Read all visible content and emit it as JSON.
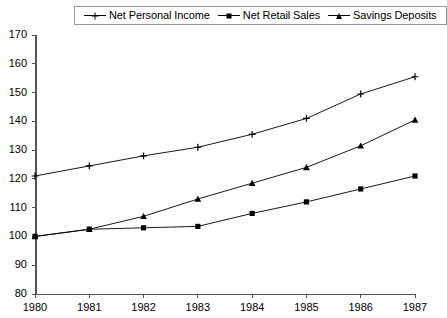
{
  "chart_data": {
    "type": "line",
    "title": "",
    "subtitle": "",
    "xlabel": "",
    "ylabel": "",
    "categories": [
      "1980",
      "1981",
      "1982",
      "1983",
      "1984",
      "1985",
      "1986",
      "1987"
    ],
    "x": [
      1980,
      1981,
      1982,
      1983,
      1984,
      1985,
      1986,
      1987
    ],
    "xlim": [
      1980,
      1987
    ],
    "ylim": [
      80,
      170
    ],
    "yticks": [
      80,
      90,
      100,
      110,
      120,
      130,
      140,
      150,
      160,
      170
    ],
    "xticks": [
      "1980",
      "1981",
      "1982",
      "1983",
      "1984",
      "1985",
      "1986",
      "1987"
    ],
    "grid": false,
    "legend_position": "top",
    "series": [
      {
        "name": "Net Personal Income",
        "marker": "plus",
        "color": "#000000",
        "values": [
          121,
          124.5,
          128,
          131,
          135.5,
          141,
          149.5,
          155.5
        ]
      },
      {
        "name": "Net Retail Sales",
        "marker": "square",
        "color": "#000000",
        "values": [
          100,
          102.5,
          103,
          103.5,
          108,
          112,
          116.5,
          121
        ]
      },
      {
        "name": "Savings Deposits",
        "marker": "triangle",
        "color": "#000000",
        "values": [
          100,
          102.5,
          107,
          113,
          118.5,
          124,
          131.5,
          140.5
        ]
      }
    ]
  },
  "legend": {
    "entries": [
      {
        "label": "Net Personal Income",
        "marker": "plus-marker-icon"
      },
      {
        "label": "Net Retail Sales",
        "marker": "square-marker-icon"
      },
      {
        "label": "Savings Deposits",
        "marker": "triangle-marker-icon"
      }
    ]
  },
  "axes": {
    "y_labels": [
      "170",
      "160",
      "150",
      "140",
      "130",
      "120",
      "110",
      "100",
      "90",
      "80"
    ],
    "x_labels": [
      "1980",
      "1981",
      "1982",
      "1983",
      "1984",
      "1985",
      "1986",
      "1987"
    ]
  }
}
